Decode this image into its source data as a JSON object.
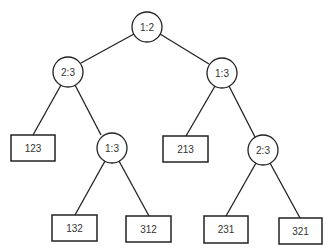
{
  "diagram": {
    "type": "decision-tree",
    "comparisons": {
      "root": "1:2",
      "left": "2:3",
      "right": "1:3",
      "left_right": "1:3",
      "right_right": "2:3"
    },
    "leaves": {
      "l1": "123",
      "l2": "132",
      "l3": "312",
      "r1": "213",
      "r2": "231",
      "r3": "321"
    }
  }
}
